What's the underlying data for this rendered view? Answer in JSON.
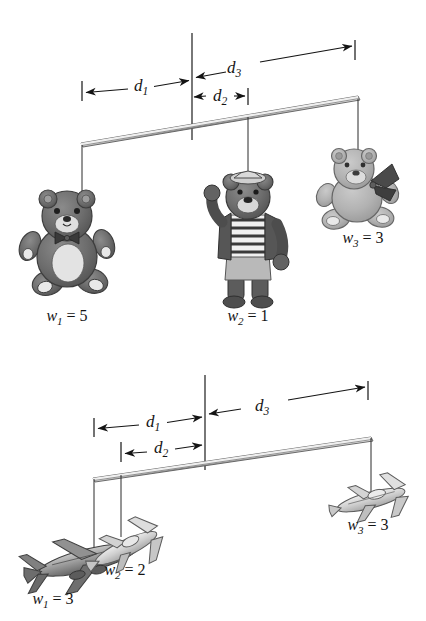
{
  "figure": {
    "background_color": "#ffffff",
    "ink_color": "#141414"
  },
  "panels": [
    {
      "id": "top-panel",
      "name": "teddy-bear-mobile",
      "dimensions": [
        {
          "id": "d1",
          "base": "d",
          "subscript": "1",
          "label": "d₁1"
        },
        {
          "id": "d2",
          "base": "d",
          "subscript": "2",
          "label": "d₁2"
        },
        {
          "id": "d3",
          "base": "d",
          "subscript": "3",
          "label": "d₁3"
        }
      ],
      "weights": [
        {
          "id": "w1",
          "base": "w",
          "subscript": "1",
          "equals": "=",
          "value": "5",
          "object": "teddy-bear-dark-sitting"
        },
        {
          "id": "w2",
          "base": "w",
          "subscript": "2",
          "equals": "=",
          "value": "1",
          "object": "teddy-bear-sailor-standing"
        },
        {
          "id": "w3",
          "base": "w",
          "subscript": "3",
          "equals": "=",
          "value": "3",
          "object": "teddy-bear-light-sitting-with-ribbon"
        }
      ]
    },
    {
      "id": "bottom-panel",
      "name": "airplane-mobile",
      "dimensions": [
        {
          "id": "d1",
          "base": "d",
          "subscript": "1",
          "label": "d₁1"
        },
        {
          "id": "d2",
          "base": "d",
          "subscript": "2",
          "label": "d₁2"
        },
        {
          "id": "d3",
          "base": "d",
          "subscript": "3",
          "label": "d₁3"
        }
      ],
      "weights": [
        {
          "id": "w1",
          "base": "w",
          "subscript": "1",
          "equals": "=",
          "value": "3",
          "object": "airliner-dark"
        },
        {
          "id": "w2",
          "base": "w",
          "subscript": "2",
          "equals": "=",
          "value": "2",
          "object": "propeller-plane-light"
        },
        {
          "id": "w3",
          "base": "w",
          "subscript": "3",
          "equals": "=",
          "value": "3",
          "object": "business-jet-light"
        }
      ]
    }
  ],
  "glyphs": {
    "d": "d",
    "w": "w",
    "equals": "="
  }
}
